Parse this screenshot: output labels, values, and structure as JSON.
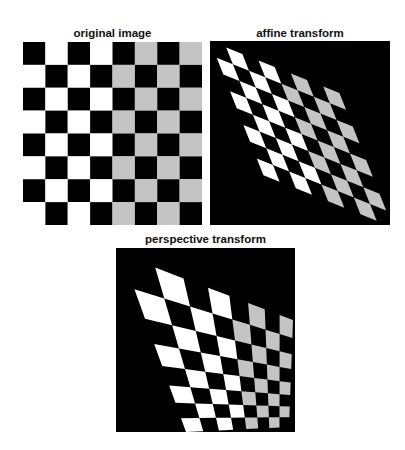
{
  "figure": {
    "panels": [
      {
        "id": "original",
        "title": "original image",
        "grid": {
          "rows": 8,
          "cols": 8
        },
        "transform": "identity"
      },
      {
        "id": "affine",
        "title": "affine transform",
        "grid": {
          "rows": 8,
          "cols": 8
        },
        "transform": "affine",
        "affine_matrix": [
          [
            0.723,
            0.292
          ],
          [
            0.29,
            0.734
          ]
        ]
      },
      {
        "id": "perspective",
        "title": "perspective transform",
        "grid": {
          "rows": 8,
          "cols": 8
        },
        "transform": "perspective",
        "quad_corners_px": {
          "top_left": [
            6,
            7
          ],
          "top_right": [
            177,
            72
          ],
          "bottom_right": [
            173,
            179
          ],
          "bottom_left": [
            70,
            184
          ]
        }
      }
    ],
    "checkerboard": {
      "pattern": "cell (row,col) is dark when (row+col) is even",
      "left_half_light_color": "#ffffff",
      "right_half_light_color": "#c4c4c4",
      "dark_color": "#000000",
      "background_after_transform": "#000000"
    }
  }
}
